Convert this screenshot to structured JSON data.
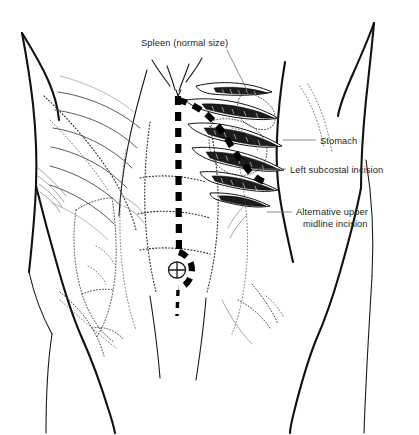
{
  "figure": {
    "background_color": "#ffffff",
    "ink_color": "#231f20",
    "leader_color": "#6d6d6d",
    "incision_color": "#000000"
  },
  "labels": [
    {
      "id": "spleen",
      "text": "Spleen (normal size)",
      "lines": [
        "Spleen (normal size)"
      ],
      "x": 141,
      "y": 46,
      "anchor": "start",
      "leader": "M 227 50 L 247 90"
    },
    {
      "id": "stomach",
      "text": "Stomach",
      "lines": [
        "Stomach"
      ],
      "x": 320,
      "y": 144,
      "anchor": "start",
      "leader": "M 283 140 L 316 140"
    },
    {
      "id": "left-subcostal-incision",
      "text": "Left subcostal incision",
      "lines": [
        "Left subcostal incision"
      ],
      "x": 290,
      "y": 173,
      "anchor": "start",
      "leader": "M 256 169 L 286 169"
    },
    {
      "id": "alternative-upper-midline-incision",
      "text": "Alternative upper midline incision",
      "lines": [
        "Alternative upper",
        "midline incision"
      ],
      "x": 296,
      "y": 215,
      "anchor": "start",
      "leader": "M 267 212 L 292 212"
    }
  ],
  "anatomy": {
    "structures": [
      "torso-outline",
      "left-ribcage",
      "right-ribcage",
      "sternum",
      "rectus-abdominis",
      "tendinous-intersections",
      "umbilicus",
      "spleen",
      "stomach",
      "colon",
      "iliac-crest"
    ]
  },
  "incisions": [
    {
      "id": "upper-midline",
      "name": "Alternative upper midline incision",
      "style": "dashed",
      "orientation": "vertical"
    },
    {
      "id": "left-subcostal",
      "name": "Left subcostal incision",
      "style": "dashed",
      "orientation": "oblique-curved"
    }
  ]
}
